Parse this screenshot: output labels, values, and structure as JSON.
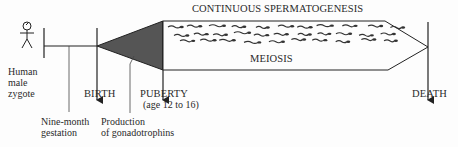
{
  "diagram": {
    "title": "CONTINUOUS SPERMATOGENESIS",
    "band_label": "MEIOSIS",
    "stages": {
      "zygote": [
        "Human",
        "male",
        "zygote"
      ],
      "birth": "BIRTH",
      "puberty": "PUBERTY",
      "puberty_age": "(age 12 to 16)",
      "death": "DEATH"
    },
    "annotations": {
      "gestation": [
        "Nine-month",
        "gestation"
      ],
      "gonadotrophins": [
        "Production",
        "of gonadotrophins"
      ]
    },
    "colors": {
      "ink": "#222222",
      "wedge_fill": "#555555",
      "background": "#fdfdfd"
    }
  }
}
